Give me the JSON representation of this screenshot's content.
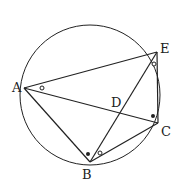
{
  "diagram": {
    "type": "geometry-circle-inscribed-quadrilateral",
    "circle": {
      "cx": 90,
      "cy": 95,
      "r": 70
    },
    "points": {
      "A": {
        "label": "A",
        "x": 24,
        "y": 88
      },
      "E": {
        "label": "E",
        "x": 157,
        "y": 52
      },
      "C": {
        "label": "C",
        "x": 158,
        "y": 123
      },
      "B": {
        "label": "B",
        "x": 90,
        "y": 162
      },
      "D": {
        "label": "D",
        "x": 120,
        "y": 109
      }
    },
    "segments": [
      "AE",
      "AC",
      "AB",
      "BE",
      "BC",
      "EC"
    ],
    "angle_marks": [
      {
        "vertex": "A",
        "mark": "open-circle"
      },
      {
        "vertex": "E",
        "mark": "open-circle"
      },
      {
        "vertex": "B",
        "mark": "open-circle"
      },
      {
        "vertex": "B",
        "mark": "filled-dot"
      },
      {
        "vertex": "C",
        "mark": "filled-dot"
      }
    ],
    "stroke_color": "#222222"
  }
}
